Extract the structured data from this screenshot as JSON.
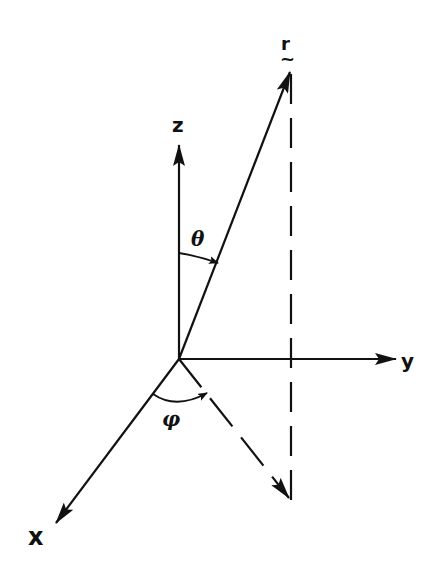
{
  "diagram": {
    "type": "spherical-coordinates",
    "origin": {
      "x": 179,
      "y": 359
    },
    "labels": {
      "z_axis": "z",
      "y_axis": "y",
      "x_axis": "x",
      "vector": "r",
      "vector_tilde": "~",
      "polar_angle": "θ",
      "azimuthal_angle": "φ"
    },
    "colors": {
      "ink": "#111111",
      "background": "#ffffff"
    }
  }
}
